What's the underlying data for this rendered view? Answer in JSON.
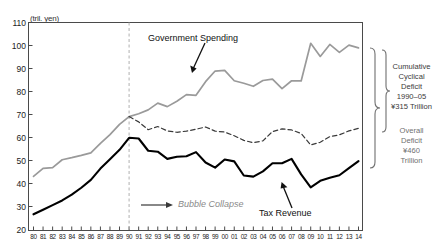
{
  "chart_data": {
    "type": "line",
    "title": "",
    "xlabel": "",
    "ylabel": "",
    "unit_label": "(tril. yen)",
    "ylim": [
      20,
      110
    ],
    "yticks": [
      20,
      30,
      40,
      50,
      60,
      70,
      80,
      90,
      100,
      110
    ],
    "grid": false,
    "legend": "inline-annotations",
    "x": [
      "80",
      "81",
      "82",
      "83",
      "84",
      "85",
      "86",
      "87",
      "88",
      "89",
      "90",
      "91",
      "92",
      "93",
      "94",
      "95",
      "96",
      "97",
      "98",
      "99",
      "00",
      "01",
      "02",
      "03",
      "04",
      "05",
      "06",
      "07",
      "08",
      "09",
      "10",
      "11",
      "12",
      "13",
      "14"
    ],
    "series": [
      {
        "name": "Government Spending",
        "style": "solid",
        "color": "#9a9a9a",
        "values": [
          43.4,
          46.9,
          47.2,
          50.6,
          51.5,
          52.5,
          53.6,
          57.7,
          61.5,
          65.9,
          69.3,
          70.5,
          72.2,
          75.1,
          73.6,
          75.9,
          78.8,
          78.5,
          84.4,
          89.0,
          89.3,
          84.8,
          83.7,
          82.4,
          84.9,
          85.5,
          81.4,
          84.8,
          84.7,
          101.0,
          95.3,
          100.5,
          97.1,
          100.2,
          99.0
        ]
      },
      {
        "name": "Counterfactual Spending (no cyclical deficit)",
        "style": "dashed",
        "color": "#3a3a3a",
        "values": [
          null,
          null,
          null,
          null,
          null,
          null,
          null,
          null,
          null,
          null,
          69.3,
          67.0,
          63.6,
          65.0,
          63.1,
          62.5,
          63.0,
          63.8,
          64.8,
          63.0,
          62.6,
          61.0,
          59.0,
          58.0,
          58.8,
          62.8,
          64.0,
          63.5,
          62.0,
          57.0,
          58.2,
          60.6,
          61.4,
          63.1,
          64.2
        ]
      },
      {
        "name": "Tax Revenue",
        "style": "solid",
        "color": "#000000",
        "values": [
          27.0,
          29.0,
          31.0,
          33.0,
          35.5,
          38.5,
          41.9,
          46.8,
          50.8,
          54.9,
          60.1,
          59.8,
          54.5,
          54.1,
          51.0,
          51.9,
          52.1,
          53.9,
          49.4,
          47.2,
          50.7,
          49.9,
          43.8,
          43.3,
          45.6,
          49.1,
          49.1,
          51.0,
          44.3,
          38.7,
          41.5,
          42.8,
          43.9,
          47.0,
          50.0
        ]
      }
    ],
    "annotations": [
      {
        "name": "government-spending",
        "text": "Government Spending",
        "kind": "series-label"
      },
      {
        "name": "tax-revenue",
        "text": "Tax Revenue",
        "kind": "series-label"
      },
      {
        "name": "bubble-collapse",
        "text": "Bubble Collapse",
        "kind": "event-marker",
        "at_x": "90"
      }
    ],
    "braces": [
      {
        "label_lines": [
          "Cumulative",
          "Cyclical",
          "Deficit",
          "1990–05",
          "¥315 Trillion"
        ]
      },
      {
        "label_lines": [
          "Overall",
          "Deficit",
          "¥460",
          "Trillion"
        ]
      }
    ]
  }
}
